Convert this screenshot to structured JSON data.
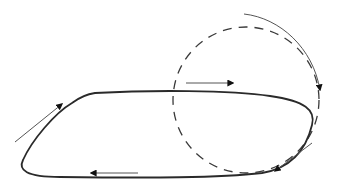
{
  "diagram": {
    "title": "",
    "colors": {
      "background": "#ffffff",
      "loop_stroke": "#2a2a2a",
      "dashed_stroke": "#3a3a3a",
      "arrow_stroke": "#555555",
      "arrowhead_fill": "#111111"
    },
    "elements": {
      "closed_loop": {
        "type": "solid-closed-curve",
        "label": ""
      },
      "dashed_circle": {
        "type": "dashed-circle",
        "center": [
          246,
          103
        ],
        "radius": 72,
        "label": ""
      },
      "outer_arc_arrow": {
        "type": "curved-arrow",
        "direction": "clockwise",
        "label": ""
      },
      "arrows": [
        {
          "id": "top-right-arrow",
          "direction": "right",
          "label": ""
        },
        {
          "id": "upper-left-arrow",
          "direction": "up-right",
          "label": ""
        },
        {
          "id": "bottom-left-arrow",
          "direction": "left",
          "label": ""
        },
        {
          "id": "lower-right-arrow",
          "direction": "down-left",
          "label": ""
        }
      ]
    }
  }
}
